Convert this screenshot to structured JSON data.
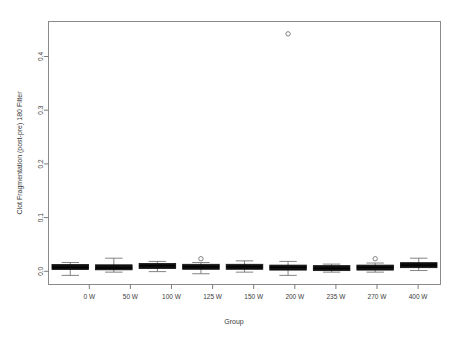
{
  "chart_data": {
    "type": "box",
    "title": "",
    "xlabel": "Group",
    "ylabel": "Clot Fragmentation (post-pre) 180 Filter",
    "categories": [
      "0 W",
      "50 W",
      "100 W",
      "125 W",
      "150 W",
      "200 W",
      "235 W",
      "270 W",
      "400 W"
    ],
    "ylim": [
      -0.035,
      0.455
    ],
    "yticks": [
      0.0,
      0.1,
      0.2,
      0.3,
      0.4
    ],
    "ytick_labels": [
      "0.0",
      "0.1",
      "0.2",
      "0.3",
      "0.4"
    ],
    "grid": false,
    "legend": null,
    "boxes": [
      {
        "category": "0 W",
        "min": -0.018,
        "q1": -0.006,
        "median": -0.003,
        "q3": 0.001,
        "max": 0.006,
        "outliers": []
      },
      {
        "category": "50 W",
        "min": -0.012,
        "q1": -0.007,
        "median": -0.004,
        "q3": 0.001,
        "max": 0.014,
        "outliers": []
      },
      {
        "category": "100 W",
        "min": -0.011,
        "q1": -0.004,
        "median": 0.0,
        "q3": 0.003,
        "max": 0.008,
        "outliers": []
      },
      {
        "category": "125 W",
        "min": -0.015,
        "q1": -0.005,
        "median": -0.002,
        "q3": 0.001,
        "max": 0.006,
        "outliers": [
          0.013
        ]
      },
      {
        "category": "150 W",
        "min": -0.012,
        "q1": -0.005,
        "median": -0.002,
        "q3": 0.001,
        "max": 0.009,
        "outliers": []
      },
      {
        "category": "200 W",
        "min": -0.018,
        "q1": -0.007,
        "median": -0.003,
        "q3": 0.0,
        "max": 0.008,
        "outliers": [
          0.432
        ]
      },
      {
        "category": "235 W",
        "min": -0.012,
        "q1": -0.007,
        "median": -0.005,
        "q3": -0.002,
        "max": 0.003,
        "outliers": []
      },
      {
        "category": "270 W",
        "min": -0.012,
        "q1": -0.006,
        "median": -0.003,
        "q3": -0.001,
        "max": 0.005,
        "outliers": [
          0.013
        ]
      },
      {
        "category": "400 W",
        "min": -0.009,
        "q1": -0.002,
        "median": 0.001,
        "q3": 0.004,
        "max": 0.014,
        "outliers": []
      }
    ],
    "colors": {
      "box_fill": "#101010",
      "frame": "#8a8a8a",
      "text": "#3a3a3a",
      "background": "#ffffff"
    }
  }
}
